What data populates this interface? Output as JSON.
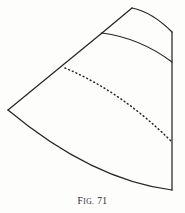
{
  "figure": {
    "caption_abbrev_first": "F",
    "caption_abbrev_rest": "ig.",
    "caption_number": "71",
    "caption_full": "Fig. 71",
    "ink_color": "#26262a",
    "paper_color": "#fdfdfc",
    "stroke_width": 1.25,
    "dotted_stroke_width": 1.5,
    "dot_pattern": "0.9 3.1"
  },
  "geometry": {
    "description": "Fan-shaped annular sector pattern development with solid outline and interior dotted arc",
    "apex": {
      "x": 132,
      "y": 8
    },
    "left_vertex": {
      "x": 8,
      "y": 110
    },
    "right_top": {
      "x": 172,
      "y": 32
    },
    "right_bottom": {
      "x": 172,
      "y": 190
    },
    "inner_arc_left": {
      "x": 102,
      "y": 33
    },
    "inner_arc_right": {
      "x": 172,
      "y": 62
    },
    "dotted_arc_start": {
      "x": 65,
      "y": 68
    },
    "dotted_arc_end": {
      "x": 172,
      "y": 142
    },
    "paths": {
      "top_arc": "M 132 8 Q 152 12 172 32",
      "upper_left_edge": "M 132 8 L 102 33",
      "inner_arc": "M 102 33 Q 140 38 172 62",
      "left_edge": "M 102 33 L 8 110",
      "bottom_arc": "M 8 110 Q 92 180 172 190",
      "right_edge": "M 172 32 L 172 190",
      "dotted_arc": "M 65 68 Q 122 92 172 142"
    }
  },
  "elements": {
    "top_arc_name": "top-outer-arc",
    "upper_left_edge_name": "apex-to-inner-arc-edge",
    "inner_arc_name": "inner-arc",
    "left_edge_name": "left-radial-edge",
    "bottom_arc_name": "bottom-outer-arc",
    "right_edge_name": "right-radial-edge",
    "dotted_arc_name": "dotted-guide-arc"
  }
}
